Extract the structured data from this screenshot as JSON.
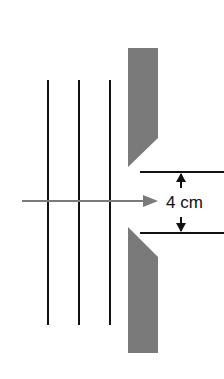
{
  "diagram": {
    "type": "single-slit diffraction setup",
    "dimension_label": "4 cm",
    "wavefronts": [
      {
        "x": 48,
        "y1": 80,
        "y2": 325
      },
      {
        "x": 79,
        "y1": 80,
        "y2": 325
      },
      {
        "x": 110,
        "y1": 80,
        "y2": 325
      }
    ],
    "incident_arrow": {
      "x1": 22,
      "x2": 155,
      "y": 201
    },
    "barrier_top_points": "128,48 158,48 158,138 128,167",
    "barrier_bottom_points": "128,227 158,257 158,353 128,353",
    "gap_lines": [
      {
        "x1": 140,
        "x2": 228,
        "y": 172
      },
      {
        "x1": 140,
        "x2": 228,
        "y": 233
      }
    ],
    "colors": {
      "barrier": "#7a7a7a",
      "wavefront": "#111111",
      "arrow": "#7a7a7a",
      "text": "#111111"
    }
  }
}
